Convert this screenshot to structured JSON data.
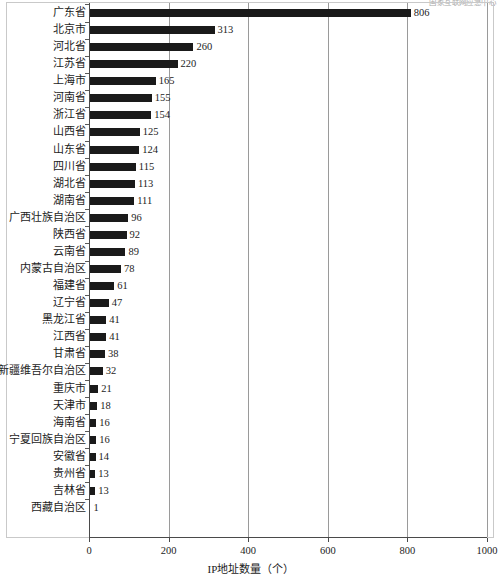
{
  "watermark": {
    "text": "国家互联网应急中心"
  },
  "chart_data": {
    "type": "bar",
    "orientation": "horizontal",
    "title": "",
    "xlabel": "IP地址数量（个）",
    "ylabel": "",
    "xlim": [
      0,
      1000
    ],
    "xticks": [
      0,
      200,
      400,
      600,
      800,
      1000
    ],
    "xtick_labels": [
      "0",
      "200",
      "400",
      "600",
      "800",
      "1000"
    ],
    "grid": true,
    "grid_axis": "x",
    "legend": false,
    "bar_color": "#1a1a1a",
    "categories": [
      "广东省",
      "北京市",
      "河北省",
      "江苏省",
      "上海市",
      "河南省",
      "浙江省",
      "山西省",
      "山东省",
      "四川省",
      "湖北省",
      "湖南省",
      "广西壮族自治区",
      "陕西省",
      "云南省",
      "内蒙古自治区",
      "福建省",
      "辽宁省",
      "黑龙江省",
      "江西省",
      "甘肃省",
      "新疆维吾尔自治区",
      "重庆市",
      "天津市",
      "海南省",
      "宁夏回族自治区",
      "安徽省",
      "贵州省",
      "吉林省",
      "西藏自治区"
    ],
    "values": [
      806,
      313,
      260,
      220,
      165,
      155,
      154,
      125,
      124,
      115,
      113,
      111,
      96,
      92,
      89,
      78,
      61,
      47,
      41,
      41,
      38,
      32,
      21,
      18,
      16,
      16,
      14,
      13,
      13,
      1
    ],
    "data_labels": [
      "806",
      "313",
      "260",
      "220",
      "165",
      "155",
      "154",
      "125",
      "124",
      "115",
      "113",
      "111",
      "96",
      "92",
      "89",
      "78",
      "61",
      "47",
      "41",
      "41",
      "38",
      "32",
      "21",
      "18",
      "16",
      "16",
      "14",
      "13",
      "13",
      "1"
    ]
  }
}
